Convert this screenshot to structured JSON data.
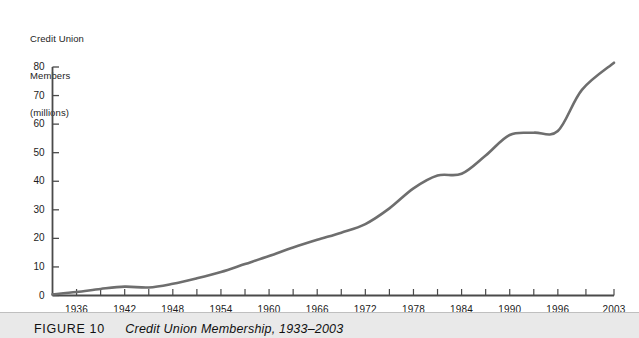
{
  "figure": {
    "caption_number": "FIGURE 10",
    "caption_title": "Credit Union Membership, 1933–2003",
    "background_color": "#ffffff",
    "caption_bar_color": "#e9e9e9"
  },
  "chart_data": {
    "type": "line",
    "title": "",
    "subtitle": "",
    "ylabel": "Credit Union Members (millions)",
    "ylabel_lines": [
      "Credit Union",
      "Members",
      "(millions)"
    ],
    "xlabel": "",
    "xlim": [
      1933,
      2003
    ],
    "ylim": [
      0,
      80
    ],
    "yticks": [
      0,
      10,
      20,
      30,
      40,
      50,
      60,
      70,
      80
    ],
    "ytick_labels": [
      "0",
      "10",
      "20",
      "30",
      "40",
      "50",
      "60",
      "70",
      "80"
    ],
    "xticks": [
      1936,
      1942,
      1948,
      1954,
      1960,
      1966,
      1972,
      1978,
      1984,
      1990,
      1996,
      2003
    ],
    "xtick_labels": [
      "1936",
      "1942",
      "1948",
      "1954",
      "1960",
      "1966",
      "1972",
      "1978",
      "1984",
      "1990",
      "1996",
      "2003"
    ],
    "grid": false,
    "legend": null,
    "line_color": "#6e6e6e",
    "line_width": 2.6,
    "axis_color": "#4a4a4a",
    "series": [
      {
        "name": "Credit Union Members (millions)",
        "x": [
          1933,
          1936,
          1939,
          1942,
          1945,
          1948,
          1951,
          1954,
          1957,
          1960,
          1963,
          1966,
          1969,
          1972,
          1975,
          1978,
          1981,
          1984,
          1987,
          1990,
          1993,
          1996,
          1999,
          2003
        ],
        "values": [
          0.4,
          1.2,
          2.3,
          3.1,
          2.8,
          4.1,
          6.0,
          8.2,
          11.0,
          13.8,
          16.8,
          19.5,
          22.0,
          25.0,
          30.5,
          37.5,
          42.0,
          42.6,
          49.0,
          56.2,
          57.0,
          57.6,
          72.0,
          81.5
        ]
      }
    ],
    "annotations": []
  }
}
